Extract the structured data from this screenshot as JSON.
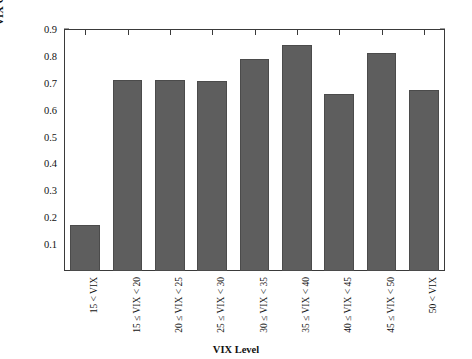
{
  "chart_data": {
    "type": "bar",
    "title": "",
    "xlabel": "VIX Level",
    "ylabel": "VIX Correlation to VVIX",
    "categories": [
      "15 < VIX",
      "15 ≤ VIX < 20",
      "20 ≤ VIX < 25",
      "25 ≤ VIX < 30",
      "30 ≤ VIX < 35",
      "35 ≤ VIX < 40",
      "40 ≤ VIX < 45",
      "45 ≤ VIX < 50",
      "50 < VIX"
    ],
    "values": [
      0.17,
      0.71,
      0.71,
      0.705,
      0.79,
      0.84,
      0.66,
      0.81,
      0.675
    ],
    "ylim": [
      0.0,
      0.9
    ],
    "yticks": [
      "0.1",
      "0.2",
      "0.3",
      "0.4",
      "0.5",
      "0.6",
      "0.7",
      "0.8",
      "0.9"
    ],
    "ytick_values": [
      0.1,
      0.2,
      0.3,
      0.4,
      0.5,
      0.6,
      0.7,
      0.8,
      0.9
    ],
    "grid": false,
    "legend": null,
    "bar_color": "#5e5e5e",
    "bar_edge_color": "#4b4b4b",
    "axis_color": "#3a3a3a",
    "background": "#ffffff"
  }
}
